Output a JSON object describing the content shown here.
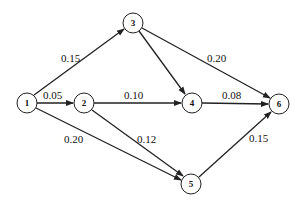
{
  "diagram": {
    "type": "directed-graph",
    "nodes": [
      {
        "id": "1",
        "label": "1",
        "x": 27,
        "y": 103
      },
      {
        "id": "2",
        "label": "2",
        "x": 84,
        "y": 103
      },
      {
        "id": "3",
        "label": "3",
        "x": 133,
        "y": 23
      },
      {
        "id": "4",
        "label": "4",
        "x": 192,
        "y": 103
      },
      {
        "id": "5",
        "label": "5",
        "x": 191,
        "y": 184
      },
      {
        "id": "6",
        "label": "6",
        "x": 279,
        "y": 104
      }
    ],
    "edges": [
      {
        "from": "1",
        "to": "3",
        "label": "0.15"
      },
      {
        "from": "1",
        "to": "2",
        "label": "0.05"
      },
      {
        "from": "1",
        "to": "5",
        "label": "0.20"
      },
      {
        "from": "2",
        "to": "4",
        "label": "0.10"
      },
      {
        "from": "2",
        "to": "5",
        "label": "0.12"
      },
      {
        "from": "3",
        "to": "4",
        "label": ""
      },
      {
        "from": "3",
        "to": "6",
        "label": "0.20"
      },
      {
        "from": "4",
        "to": "6",
        "label": "0.08"
      },
      {
        "from": "5",
        "to": "6",
        "label": "0.15"
      }
    ]
  },
  "labels": {
    "n1": "1",
    "n2": "2",
    "n3": "3",
    "n4": "4",
    "n5": "5",
    "n6": "6",
    "e13": "0.15",
    "e12": "0.05",
    "e15": "0.20",
    "e24": "0.10",
    "e25": "0.12",
    "e36": "0.20",
    "e46": "0.08",
    "e56": "0.15"
  }
}
